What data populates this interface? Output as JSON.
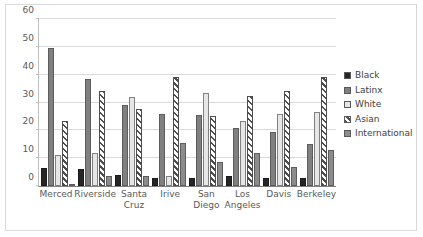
{
  "chart_data": {
    "type": "bar",
    "title": "",
    "xlabel": "",
    "ylabel": "",
    "ylim": [
      0,
      60
    ],
    "yticks": [
      0,
      10,
      20,
      30,
      40,
      50,
      60
    ],
    "grid": true,
    "legend_position": "right",
    "categories": [
      "Merced",
      "Riverside",
      "Santa Cruz",
      "Irive",
      "San Diego",
      "Los Angeles",
      "Davis",
      "Berkeley"
    ],
    "series": [
      {
        "name": "Black",
        "color": "#262626",
        "pattern": "solid",
        "values": [
          6.5,
          6.0,
          4.0,
          3.0,
          3.0,
          3.5,
          3.0,
          3.0
        ]
      },
      {
        "name": "Latinx",
        "color": "#808080",
        "pattern": "solid",
        "values": [
          49.5,
          38.5,
          29.0,
          26.0,
          25.5,
          21.0,
          19.5,
          15.0
        ]
      },
      {
        "name": "White",
        "color": "#e6e6e6",
        "pattern": "solid",
        "values": [
          11.0,
          12.0,
          32.0,
          3.5,
          33.5,
          23.5,
          26.0,
          26.5
        ]
      },
      {
        "name": "Asian",
        "color": "#4d4d4d",
        "pattern": "diagonal-hatch",
        "values": [
          23.5,
          34.0,
          27.5,
          39.0,
          25.0,
          32.5,
          34.0,
          39.0
        ]
      },
      {
        "name": "International",
        "color": "#8c8c8c",
        "pattern": "solid",
        "values": [
          0.3,
          3.5,
          3.5,
          15.5,
          8.5,
          12.0,
          7.0,
          13.0
        ]
      }
    ]
  }
}
